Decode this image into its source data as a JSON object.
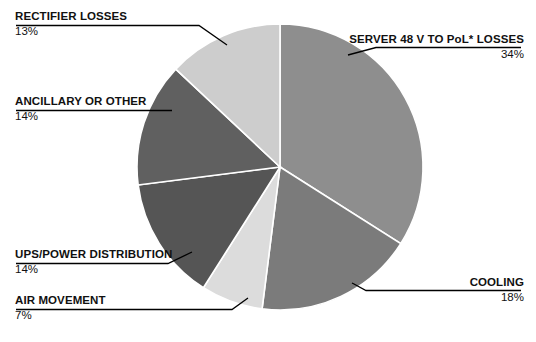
{
  "chart_data": {
    "type": "pie",
    "title": "",
    "subtitle": "",
    "xlabel": "",
    "ylabel": "",
    "legend_position": "callout-labels",
    "grid": false,
    "units": "percent",
    "total": 100,
    "start_angle_deg": 0,
    "direction": "clockwise",
    "categories": [
      "SERVER 48 V TO PoL* LOSSES",
      "COOLING",
      "AIR MOVEMENT",
      "UPS/POWER DISTRIBUTION",
      "ANCILLARY OR OTHER",
      "RECTIFIER LOSSES"
    ],
    "values": [
      34,
      18,
      7,
      14,
      14,
      13
    ],
    "value_labels": [
      "34%",
      "18%",
      "7%",
      "14%",
      "14%",
      "13%"
    ],
    "colors": [
      "#8e8e8e",
      "#7b7b7b",
      "#dcdcdc",
      "#555555",
      "#606060",
      "#cdcdcd"
    ],
    "slices": [
      {
        "label": "SERVER 48 V TO PoL* LOSSES",
        "value": 34,
        "value_label": "34%",
        "color": "#8e8e8e",
        "start_deg": 0,
        "end_deg": 122.4
      },
      {
        "label": "COOLING",
        "value": 18,
        "value_label": "18%",
        "color": "#7b7b7b",
        "start_deg": 122.4,
        "end_deg": 187.2
      },
      {
        "label": "AIR MOVEMENT",
        "value": 7,
        "value_label": "7%",
        "color": "#dcdcdc",
        "start_deg": 187.2,
        "end_deg": 212.4
      },
      {
        "label": "UPS/POWER DISTRIBUTION",
        "value": 14,
        "value_label": "14%",
        "color": "#555555",
        "start_deg": 212.4,
        "end_deg": 262.8
      },
      {
        "label": "ANCILLARY OR OTHER",
        "value": 14,
        "value_label": "14%",
        "color": "#606060",
        "start_deg": 262.8,
        "end_deg": 313.2
      },
      {
        "label": "RECTIFIER LOSSES",
        "value": 13,
        "value_label": "13%",
        "color": "#cdcdcd",
        "start_deg": 313.2,
        "end_deg": 360
      }
    ]
  },
  "callouts": {
    "rectifier": {
      "label": "RECTIFIER LOSSES",
      "percent": "13%"
    },
    "ancillary": {
      "label": "ANCILLARY OR OTHER",
      "percent": "14%"
    },
    "ups": {
      "label": "UPS/POWER DISTRIBUTION",
      "percent": "14%"
    },
    "air": {
      "label": "AIR MOVEMENT",
      "percent": "7%"
    },
    "server": {
      "label": "SERVER 48 V TO PoL* LOSSES",
      "percent": "34%"
    },
    "cooling": {
      "label": "COOLING",
      "percent": "18%"
    }
  },
  "style": {
    "background": "#ffffff",
    "text_color": "#111111",
    "leader_line_color": "#000000",
    "slice_separator_color": "#ffffff"
  }
}
